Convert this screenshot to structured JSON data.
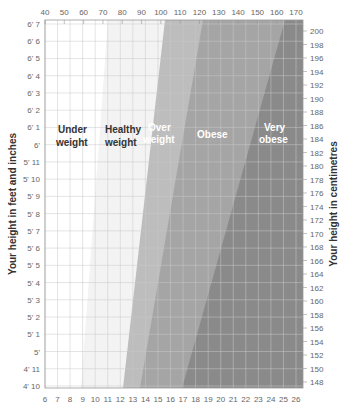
{
  "chart_data": {
    "type": "area",
    "title": "",
    "xlabel_top": "",
    "xlabel_bottom": "",
    "ylabel_left": "Your height in feet and inches",
    "ylabel_right": "Your height in centimetres",
    "top_ticks": [
      "40",
      "50",
      "60",
      "70",
      "80",
      "90",
      "100",
      "110",
      "120",
      "130",
      "140",
      "150",
      "160",
      "170"
    ],
    "bottom_ticks": [
      "6",
      "7",
      "8",
      "9",
      "10",
      "11",
      "12",
      "13",
      "14",
      "15",
      "16",
      "17",
      "18",
      "19",
      "20",
      "21",
      "22",
      "23",
      "24",
      "25",
      "26"
    ],
    "left_ticks": [
      "6' 7",
      "6' 6",
      "6' 5",
      "6' 4",
      "6' 3",
      "6' 2",
      "6' 1",
      "6'",
      "5' 11",
      "5' 10",
      "5' 9",
      "5' 8",
      "5' 7",
      "5' 6",
      "5' 5",
      "5' 4",
      "5' 3",
      "5' 2",
      "5' 1",
      "5'",
      "4' 11",
      "4' 10"
    ],
    "right_ticks": [
      "200",
      "198",
      "196",
      "194",
      "192",
      "190",
      "188",
      "186",
      "184",
      "182",
      "180",
      "178",
      "176",
      "174",
      "172",
      "170",
      "168",
      "166",
      "164",
      "162",
      "160",
      "158",
      "156",
      "154",
      "152",
      "150",
      "148"
    ],
    "grid": true,
    "zones": [
      {
        "name": "Under weight",
        "line1": "Under",
        "line2": "weight",
        "color": "#ffffff",
        "label_color": "#333333"
      },
      {
        "name": "Healthy weight",
        "line1": "Healthy",
        "line2": "weight",
        "color": "#f3f3f3",
        "label_color": "#333333"
      },
      {
        "name": "Over weight",
        "line1": "Over",
        "line2": "weight",
        "color": "#bdbdbd",
        "label_color": "#ffffff"
      },
      {
        "name": "Obese",
        "line1": "Obese",
        "line2": "",
        "color": "#a5a5a5",
        "label_color": "#ffffff"
      },
      {
        "name": "Very obese",
        "line1": "Very",
        "line2": "obese",
        "color": "#8a8a8a",
        "label_color": "#ffffff"
      }
    ],
    "boundaries_stone_at_top_and_bottom": [
      {
        "between": "Under weight / Healthy weight",
        "top_stone_approx": 11.6,
        "bottom_stone_approx": 9.0
      },
      {
        "between": "Healthy weight / Over weight",
        "top_stone_approx": 15.9,
        "bottom_stone_approx": 12.7
      },
      {
        "between": "Over weight / Obese",
        "top_stone_approx": 19.0,
        "bottom_stone_approx": 14.0
      },
      {
        "between": "Obese / Very obese",
        "top_stone_approx": 25.5,
        "bottom_stone_approx": 17.0
      }
    ]
  }
}
